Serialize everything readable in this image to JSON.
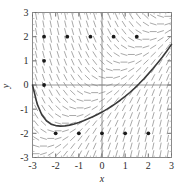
{
  "figure": {
    "title": "",
    "background_color": "#ffffff",
    "frame_color": "#8a8a8a",
    "curve_color": "#3a3a3a",
    "field_color": "#9a9a9a",
    "point_color": "#1a1a1a"
  },
  "axes": {
    "x_label": "x",
    "y_label": "y",
    "x_ticks": [
      "-3",
      "-2",
      "-1",
      "0",
      "1",
      "2",
      "3"
    ],
    "y_ticks": [
      "3",
      "2",
      "1",
      "0",
      "-1",
      "-2",
      "-3"
    ]
  },
  "chart_data": {
    "type": "line",
    "title": "",
    "xlabel": "x",
    "ylabel": "y",
    "xlim": [
      -3,
      3
    ],
    "ylim": [
      -3,
      3
    ],
    "xticks": [
      -3,
      -2,
      -1,
      0,
      1,
      2,
      3
    ],
    "yticks": [
      -3,
      -2,
      -1,
      0,
      1,
      2,
      3
    ],
    "grid": false,
    "legend": "none",
    "slope_field": {
      "description": "direction field of dy/dx = x - y",
      "x_range": [
        -3,
        3
      ],
      "y_range": [
        -3,
        3
      ],
      "nx": 19,
      "ny": 19,
      "slope_formula": "x - y"
    },
    "series": [
      {
        "name": "solution curve",
        "type": "line",
        "x": [
          -3.0,
          -2.8,
          -2.6,
          -2.4,
          -2.2,
          -2.0,
          -1.8,
          -1.6,
          -1.4,
          -1.2,
          -1.0,
          -0.8,
          -0.6,
          -0.4,
          -0.2,
          0.0,
          0.2,
          0.4,
          0.6,
          0.8,
          1.0,
          1.2,
          1.4,
          1.6,
          1.8,
          2.0,
          2.2,
          2.4,
          2.6,
          2.8,
          3.0
        ],
        "y": [
          0.0,
          -0.78,
          -1.23,
          -1.48,
          -1.62,
          -1.68,
          -1.7,
          -1.69,
          -1.66,
          -1.61,
          -1.55,
          -1.48,
          -1.4,
          -1.31,
          -1.22,
          -1.12,
          -1.01,
          -0.89,
          -0.76,
          -0.62,
          -0.47,
          -0.31,
          -0.14,
          0.05,
          0.25,
          0.46,
          0.68,
          0.91,
          1.15,
          1.41,
          1.68
        ]
      },
      {
        "name": "marked points",
        "type": "scatter",
        "points": [
          {
            "x": -2.5,
            "y": 2
          },
          {
            "x": -1.5,
            "y": 2
          },
          {
            "x": -0.5,
            "y": 2
          },
          {
            "x": 0.5,
            "y": 2
          },
          {
            "x": 1.5,
            "y": 2
          },
          {
            "x": -2.5,
            "y": 1
          },
          {
            "x": -2.5,
            "y": 0
          },
          {
            "x": -2.0,
            "y": -2
          },
          {
            "x": -1.0,
            "y": -2
          },
          {
            "x": 0.0,
            "y": -2
          },
          {
            "x": 1.0,
            "y": -2
          },
          {
            "x": 2.0,
            "y": -2
          }
        ]
      }
    ]
  }
}
